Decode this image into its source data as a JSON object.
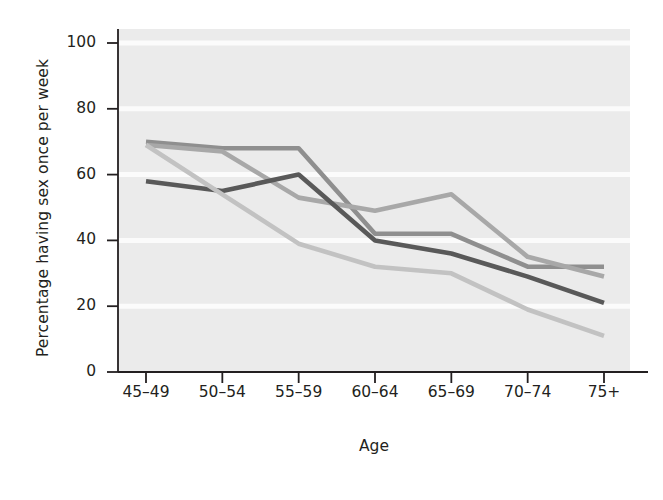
{
  "chart_data": {
    "type": "line",
    "title": "",
    "subtitle": "",
    "xlabel": "Age",
    "ylabel": "Percentage having sex once per week",
    "categories": [
      "45–49",
      "50–54",
      "55–59",
      "60–64",
      "65–69",
      "70–74",
      "75+"
    ],
    "xlim": [
      0,
      6
    ],
    "ylim": [
      0,
      100
    ],
    "yticks": [
      0,
      20,
      40,
      60,
      80,
      100
    ],
    "ytick_labels": [
      "0",
      "20",
      "40",
      "60",
      "80",
      "100"
    ],
    "grid": "horizontal-white-gridlines-on-light-gray-panel",
    "legend": "none",
    "series": [
      {
        "name": "series-1-medium-gray",
        "color": "#8f8f8f",
        "values": [
          70,
          68,
          68,
          42,
          42,
          32,
          32
        ]
      },
      {
        "name": "series-2-mid-light-gray",
        "color": "#a8a8a8",
        "values": [
          69,
          67,
          53,
          49,
          54,
          35,
          29
        ]
      },
      {
        "name": "series-3-dark-gray",
        "color": "#595959",
        "values": [
          58,
          55,
          60,
          40,
          36,
          29,
          21
        ]
      },
      {
        "name": "series-4-light-gray",
        "color": "#c2c2c2",
        "values": [
          69,
          54,
          39,
          32,
          30,
          19,
          11
        ]
      }
    ],
    "annotations": []
  },
  "figure": {
    "panel_background": "#ebebeb",
    "gridline_color": "#fbfbfb",
    "axis_color": "#231f20",
    "page_background": "#ffffff"
  }
}
